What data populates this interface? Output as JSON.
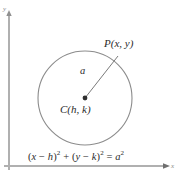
{
  "figure": {
    "axes": {
      "y_label": "y",
      "x_label": "x",
      "origin_x": 9,
      "origin_y": 166,
      "x_axis_end": 168,
      "y_axis_top": 14,
      "axis_color": "#a9a9a9"
    },
    "circle": {
      "center_x": 85,
      "center_y": 98,
      "radius": 47,
      "stroke_color": "#8c8c8c",
      "stroke_width": 1,
      "center_label": "C(h, k)",
      "center_dot_color": "#333333"
    },
    "radius_segment": {
      "from_x": 85,
      "from_y": 98,
      "to_x": 118,
      "to_y": 56,
      "label": "a",
      "stroke_color": "#7a7a7a"
    },
    "point_p": {
      "label": "P(x, y)",
      "x": 118,
      "y": 56
    },
    "equation": {
      "full": "(x − h)² + (y − k)² = a²",
      "lhs_term1_open": "(",
      "lhs_term1_var": "x",
      "lhs_minus1": " − ",
      "lhs_term1_param": "h",
      "lhs_term1_close": ")",
      "exp1": "2",
      "plus": " + ",
      "lhs_term2_open": "(",
      "lhs_term2_var": "y",
      "lhs_minus2": " − ",
      "lhs_term2_param": "k",
      "lhs_term2_close": ")",
      "exp2": "2",
      "equals": " = ",
      "rhs_var": "a",
      "exp3": "2"
    }
  }
}
